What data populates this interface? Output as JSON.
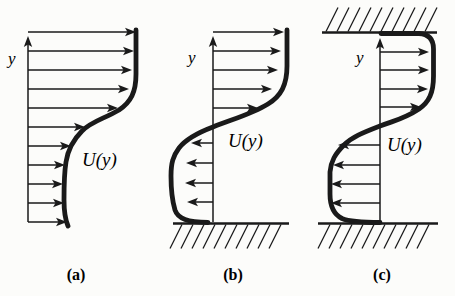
{
  "figure": {
    "background": "#fcfcfa",
    "ink": "#1a1a1a",
    "hatch": {
      "spacing": 11,
      "dx": 12,
      "dy": 24
    },
    "panels": [
      {
        "id": "a",
        "caption": "(a)",
        "axis_label": "y",
        "profile_label": "U(y)",
        "axis": {
          "x": 28,
          "y_top": 36,
          "y_bottom": 222
        },
        "walls": [],
        "hatch_regions": [],
        "arrows": [
          {
            "y": 32,
            "tip": 136
          },
          {
            "y": 51,
            "tip": 134
          },
          {
            "y": 70,
            "tip": 132
          },
          {
            "y": 89,
            "tip": 129
          },
          {
            "y": 108,
            "tip": 118
          },
          {
            "y": 127,
            "tip": 85
          },
          {
            "y": 146,
            "tip": 71
          },
          {
            "y": 165,
            "tip": 65
          },
          {
            "y": 184,
            "tip": 63
          },
          {
            "y": 203,
            "tip": 64
          },
          {
            "y": 222,
            "tip": 67
          }
        ],
        "curve_path": "M 136,30 L 136,74 C 136,92 131,102 119,110 C 104,119 92,121 82,131 C 73,140 68,149 66,162 C 64,174 64,185 64,200 C 64,212 65,219 68,226"
      },
      {
        "id": "b",
        "caption": "(b)",
        "axis_label": "y",
        "profile_label": "U(y)",
        "axis": {
          "x": 213,
          "y_top": 36,
          "y_bottom": 222
        },
        "walls": [
          {
            "x1": 173,
            "x2": 289,
            "y": 223.5
          }
        ],
        "hatch_regions": [
          {
            "y": 224.5,
            "x_start": 182,
            "x_end": 289,
            "side": "below"
          }
        ],
        "arrows": [
          {
            "y": 32,
            "tip": 284
          },
          {
            "y": 51,
            "tip": 281
          },
          {
            "y": 70,
            "tip": 278
          },
          {
            "y": 89,
            "tip": 272
          },
          {
            "y": 108,
            "tip": 258
          },
          {
            "y": 143,
            "tip": 191
          },
          {
            "y": 163,
            "tip": 186
          },
          {
            "y": 183,
            "tip": 185
          },
          {
            "y": 202,
            "tip": 187
          }
        ],
        "curve_path": "M 287,30 L 287,66 C 287,85 281,96 268,104 C 252,114 233,119 213,127 C 197,133 186,139 179,148 C 173,156 171,163 171,176 C 171,190 172,200 175,210 C 178,219 188,222 208,222.5"
      },
      {
        "id": "c",
        "caption": "(c)",
        "axis_label": "y",
        "profile_label": "U(y)",
        "axis": {
          "x": 380,
          "y_top": 38,
          "y_bottom": 222
        },
        "walls": [
          {
            "x1": 322,
            "x2": 437,
            "y": 32.5
          },
          {
            "x1": 318,
            "x2": 438,
            "y": 223.5
          }
        ],
        "hatch_regions": [
          {
            "y": 31.5,
            "x_start": 326,
            "x_end": 430,
            "side": "above"
          },
          {
            "y": 224.5,
            "x_start": 330,
            "x_end": 436,
            "side": "below"
          }
        ],
        "arrows": [
          {
            "y": 52,
            "tip": 429
          },
          {
            "y": 70,
            "tip": 429
          },
          {
            "y": 89,
            "tip": 428
          },
          {
            "y": 107,
            "tip": 421
          },
          {
            "y": 145,
            "tip": 338
          },
          {
            "y": 165,
            "tip": 333
          },
          {
            "y": 184,
            "tip": 331
          },
          {
            "y": 203,
            "tip": 331
          }
        ],
        "curve_path": "M 381,33.5 L 419,33.5 C 428,34 433.5,39 433.5,49 L 433.5,76 C 433.5,93 429,102 419,109 C 404,119 396,120 380,126 C 362,133 352,137 344,145 C 335,154 331,161 330,172 L 330,194 C 330,206 333,214 342,218.5 C 350,222 362,222.5 380,222.5"
      }
    ]
  }
}
